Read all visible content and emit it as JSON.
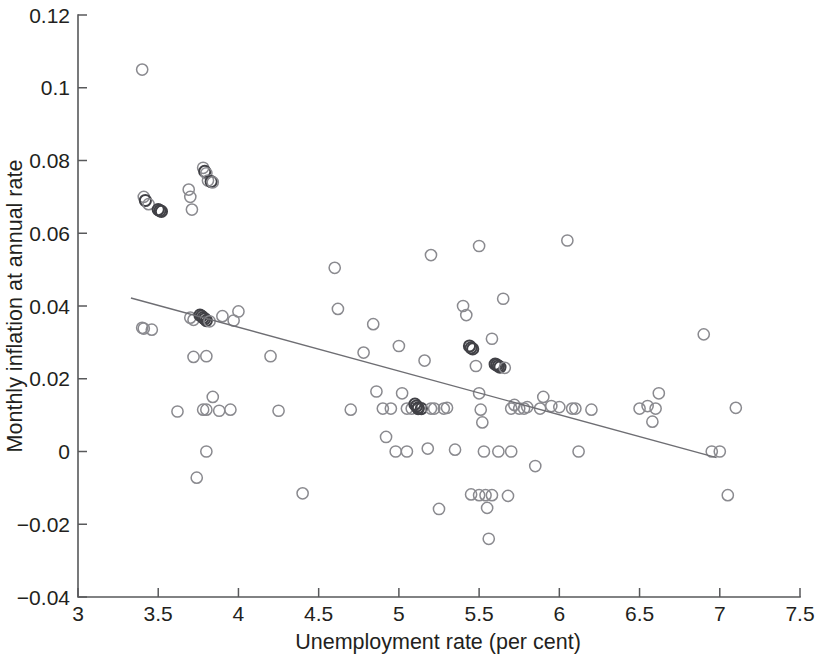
{
  "chart_data": {
    "type": "scatter",
    "title": "",
    "xlabel": "Unemployment rate (per cent)",
    "ylabel": "Monthly inflation at annual rate",
    "xlim": [
      3,
      7.5
    ],
    "ylim": [
      -0.04,
      0.12
    ],
    "xticks": [
      3,
      3.5,
      4,
      4.5,
      5,
      5.5,
      6,
      6.5,
      7,
      7.5
    ],
    "xtick_labels": [
      "3",
      "3.5",
      "4",
      "4.5",
      "5",
      "5.5",
      "6",
      "6.5",
      "7",
      "7.5"
    ],
    "yticks": [
      -0.04,
      -0.02,
      0,
      0.02,
      0.04,
      0.06,
      0.08,
      0.1,
      0.12
    ],
    "ytick_labels": [
      "−0.04",
      "−0.02",
      "0",
      "0.02",
      "0.04",
      "0.06",
      "0.08",
      "0.1",
      "0.12"
    ],
    "grid": false,
    "legend": "none",
    "marker": "open-circle",
    "marker_color": "#8a8a8f",
    "trend_color": "#6e6e73",
    "x": [
      3.4,
      3.41,
      3.42,
      3.44,
      3.5,
      3.51,
      3.52,
      3.4,
      3.41,
      3.46,
      3.69,
      3.7,
      3.71,
      3.78,
      3.79,
      3.8,
      3.81,
      3.83,
      3.84,
      3.7,
      3.72,
      3.76,
      3.77,
      3.78,
      3.79,
      3.8,
      3.82,
      3.9,
      3.97,
      4.0,
      3.72,
      3.8,
      3.84,
      3.78,
      3.8,
      3.62,
      3.74,
      3.95,
      4.2,
      4.25,
      3.8,
      3.88,
      4.4,
      4.6,
      4.62,
      4.7,
      4.78,
      4.84,
      4.86,
      4.9,
      4.92,
      4.95,
      5.0,
      5.02,
      5.05,
      5.08,
      5.1,
      5.11,
      5.12,
      5.14,
      5.16,
      5.18,
      5.2,
      5.22,
      5.25,
      5.3,
      5.35,
      5.4,
      5.42,
      5.44,
      5.45,
      5.46,
      5.48,
      5.5,
      5.5,
      5.51,
      5.52,
      5.53,
      5.54,
      5.55,
      5.56,
      5.58,
      5.6,
      5.61,
      5.62,
      5.63,
      5.65,
      5.66,
      5.68,
      5.7,
      5.72,
      5.75,
      5.78,
      5.8,
      5.85,
      5.88,
      5.9,
      5.95,
      6.0,
      6.05,
      6.08,
      6.1,
      6.12,
      6.2,
      6.5,
      6.55,
      6.58,
      6.6,
      6.62,
      6.9,
      6.95,
      7.0,
      7.05,
      7.1,
      5.2,
      5.28,
      5.45,
      5.5,
      5.58,
      5.62,
      5.7,
      4.98,
      5.05,
      5.12
    ],
    "y": [
      0.105,
      0.07,
      0.069,
      0.068,
      0.0665,
      0.0662,
      0.066,
      0.034,
      0.0338,
      0.0335,
      0.072,
      0.07,
      0.0665,
      0.078,
      0.077,
      0.0765,
      0.0745,
      0.0742,
      0.074,
      0.0368,
      0.0362,
      0.0375,
      0.0372,
      0.0368,
      0.0365,
      0.036,
      0.0358,
      0.0372,
      0.036,
      0.0385,
      0.026,
      0.0262,
      0.015,
      0.0115,
      0.0,
      0.011,
      -0.0072,
      0.0115,
      0.0262,
      0.0112,
      0.0115,
      0.0112,
      -0.0115,
      0.0505,
      0.0392,
      0.0115,
      0.0272,
      0.035,
      0.0165,
      0.0118,
      0.004,
      0.0118,
      0.029,
      0.016,
      0.0118,
      0.0118,
      0.013,
      0.0125,
      0.012,
      0.0118,
      0.025,
      0.0008,
      0.054,
      0.0118,
      -0.0158,
      0.012,
      0.0005,
      0.04,
      0.0375,
      0.029,
      0.0285,
      0.0282,
      0.0235,
      0.0565,
      0.016,
      0.0115,
      0.008,
      0.0,
      -0.012,
      -0.0155,
      -0.024,
      0.031,
      0.024,
      0.0238,
      0.0235,
      0.0232,
      0.042,
      0.023,
      -0.0122,
      0.0,
      0.0128,
      0.0118,
      0.0118,
      0.0122,
      -0.004,
      0.0118,
      0.015,
      0.0125,
      0.0122,
      0.058,
      0.0118,
      0.0118,
      0.0,
      0.0115,
      0.0118,
      0.0125,
      0.0082,
      0.0118,
      0.016,
      0.0322,
      0.0,
      0.0,
      -0.012,
      0.012,
      0.0118,
      0.0118,
      -0.0118,
      -0.012,
      -0.012,
      0.0,
      0.0118,
      0.0,
      0.0,
      0.0118
    ],
    "trendline": {
      "x_start": 3.33,
      "y_start": 0.0422,
      "x_end": 6.98,
      "y_end": -0.0017,
      "slope": -0.012,
      "intercept": 0.0823
    }
  }
}
